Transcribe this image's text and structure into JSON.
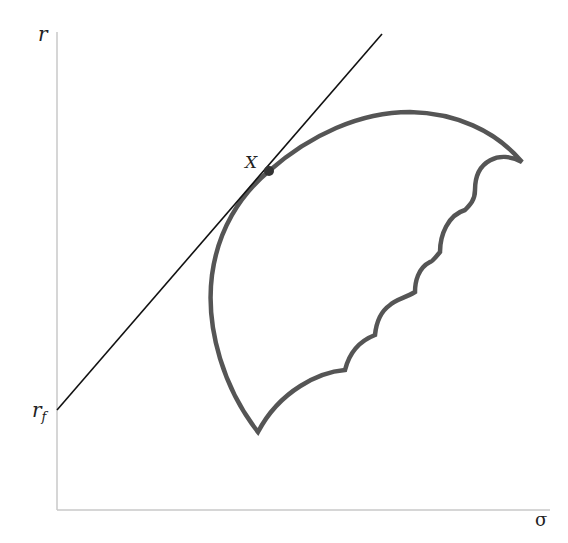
{
  "diagram": {
    "title": "",
    "axes": {
      "y_label": "r",
      "x_label": "σ",
      "y_intercept_label_main": "r",
      "y_intercept_label_sub": "f"
    },
    "point": {
      "label": "X"
    },
    "elements": [
      "y-axis",
      "x-axis",
      "capital-market-line (tangent from r_f)",
      "tangency-point X",
      "feasible-set boundary (efficient frontier arc + scalloped lower edge)"
    ],
    "colors": {
      "axis": "#c8c8c8",
      "tangent_line": "#111111",
      "feasible_set": "#555555",
      "point": "#333333",
      "label": "#222222"
    }
  }
}
